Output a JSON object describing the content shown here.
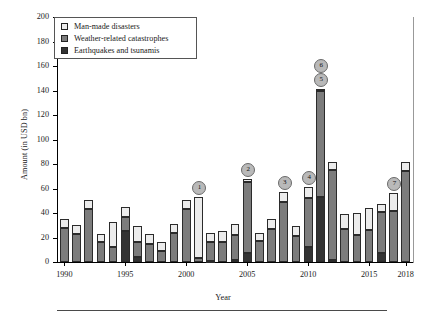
{
  "chart_data": {
    "type": "bar",
    "subtype": "stacked-bar",
    "title": "",
    "xlabel": "Year",
    "ylabel": "Amount (in USD bn)",
    "ylim": [
      0,
      200
    ],
    "ytick_step": 20,
    "yticks": [
      0,
      20,
      40,
      60,
      80,
      100,
      120,
      140,
      160,
      180,
      200
    ],
    "xlim": [
      1989.4,
      2018.6
    ],
    "xticks": [
      1990,
      1995,
      2000,
      2005,
      2010,
      2015,
      2018
    ],
    "xticklabels": [
      "1990",
      "1995",
      "2000",
      "2005",
      "2010",
      "2015",
      "2018"
    ],
    "grid": false,
    "legend_position": "upper left",
    "categories": [
      1990,
      1991,
      1992,
      1993,
      1994,
      1995,
      1996,
      1997,
      1998,
      1999,
      2000,
      2001,
      2002,
      2003,
      2004,
      2005,
      2006,
      2007,
      2008,
      2009,
      2010,
      2011,
      2012,
      2013,
      2014,
      2015,
      2016,
      2017,
      2018
    ],
    "series": [
      {
        "name": "Earthquakes and tsunamis",
        "color": "#333333",
        "values": [
          0,
          0,
          0,
          0,
          0,
          25,
          4,
          0,
          0,
          0,
          0,
          0,
          1,
          0,
          2,
          7,
          0,
          0,
          0,
          0,
          12,
          53,
          2,
          0,
          0,
          0,
          7,
          0,
          0
        ]
      },
      {
        "name": "Weather-related catastrophes",
        "color": "#7c7c7c",
        "values": [
          28,
          23,
          43,
          16,
          12,
          12,
          12,
          15,
          9,
          24,
          43,
          3,
          15,
          16,
          20,
          58,
          17,
          27,
          49,
          21,
          40,
          87,
          73,
          27,
          22,
          26,
          34,
          42,
          74
        ]
      },
      {
        "name": "Man-made disasters",
        "color": "#ececec",
        "values": [
          7,
          7,
          8,
          7,
          21,
          8,
          13,
          8,
          7,
          7,
          8,
          50,
          8,
          9,
          9,
          3,
          7,
          8,
          8,
          8,
          9,
          1,
          7,
          12,
          18,
          18,
          6,
          14,
          8
        ]
      }
    ],
    "totals": [
      35,
      30,
      51,
      23,
      33,
      45,
      29,
      23,
      16,
      31,
      51,
      53,
      24,
      25,
      31,
      68,
      24,
      35,
      57,
      29,
      61,
      141,
      82,
      39,
      40,
      44,
      47,
      56,
      82
    ],
    "annotations": [
      {
        "label": "1",
        "year": 2001,
        "value": 53
      },
      {
        "label": "2",
        "year": 2005,
        "value": 68
      },
      {
        "label": "3",
        "year": 2008,
        "value": 57
      },
      {
        "label": "4",
        "year": 2010,
        "value": 61
      },
      {
        "label": "5",
        "year": 2011,
        "value": 141
      },
      {
        "label": "6",
        "year": 2011,
        "value": 141
      },
      {
        "label": "7",
        "year": 2017,
        "value": 56
      }
    ]
  },
  "legend": {
    "items": [
      {
        "label": "Man-made disasters",
        "color": "#ececec"
      },
      {
        "label": "Weather-related catastrophes",
        "color": "#7c7c7c"
      },
      {
        "label": "Earthquakes and tsunamis",
        "color": "#333333"
      }
    ]
  }
}
